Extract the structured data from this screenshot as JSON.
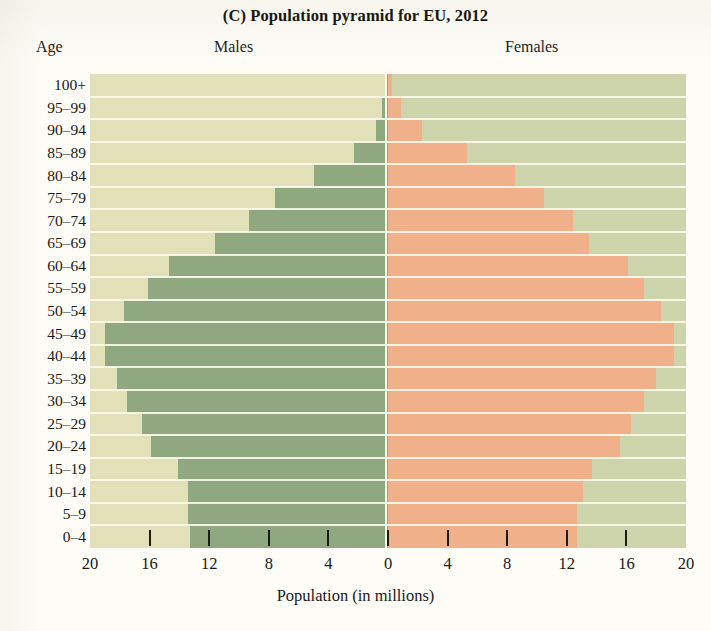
{
  "chart_data": {
    "type": "bar",
    "subtype": "population-pyramid",
    "title": "(C) Population pyramid for EU, 2012",
    "panel_label": "(C)",
    "title_rest": "Population pyramid for EU, 2012",
    "xlabel": "Population (in millions)",
    "ylabel": "Age",
    "grid": false,
    "legend_position": "top-inline",
    "axis_labels": {
      "age": "Age",
      "males": "Males",
      "females": "Females"
    },
    "xlim": [
      -20,
      20
    ],
    "xtick_labels": [
      "20",
      "16",
      "12",
      "8",
      "4",
      "0",
      "4",
      "8",
      "12",
      "16",
      "20"
    ],
    "xtick_values": [
      -20,
      -16,
      -12,
      -8,
      -4,
      0,
      4,
      8,
      12,
      16,
      20
    ],
    "categories": [
      "100+",
      "95–99",
      "90–94",
      "85–89",
      "80–84",
      "75–79",
      "70–74",
      "65–69",
      "60–64",
      "55–59",
      "50–54",
      "45–49",
      "40–44",
      "35–39",
      "30–34",
      "25–29",
      "20–24",
      "15–19",
      "10–14",
      "5–9",
      "0–4"
    ],
    "series": [
      {
        "name": "Males",
        "color": "#8fa87f",
        "values": [
          0.2,
          0.4,
          0.8,
          2.3,
          5.0,
          7.6,
          9.3,
          11.6,
          14.7,
          16.1,
          17.7,
          19.0,
          19.0,
          18.2,
          17.5,
          16.5,
          15.9,
          14.1,
          13.4,
          13.4,
          13.3
        ]
      },
      {
        "name": "Females",
        "color": "#efb08a",
        "values": [
          0.3,
          0.9,
          2.3,
          5.3,
          8.5,
          10.5,
          12.4,
          13.5,
          16.1,
          17.2,
          18.3,
          19.2,
          19.2,
          18.0,
          17.2,
          16.3,
          15.6,
          13.7,
          13.1,
          12.7,
          12.7
        ]
      }
    ],
    "colors": {
      "male_bar": "#8fa87f",
      "female_bar": "#efb08a",
      "panel_left_background": "#e2e0b8",
      "panel_right_background": "#cdd3ab",
      "row_separator": "#fbf8e8",
      "page_background": "#fdfcf7",
      "text": "#1b1915"
    }
  }
}
